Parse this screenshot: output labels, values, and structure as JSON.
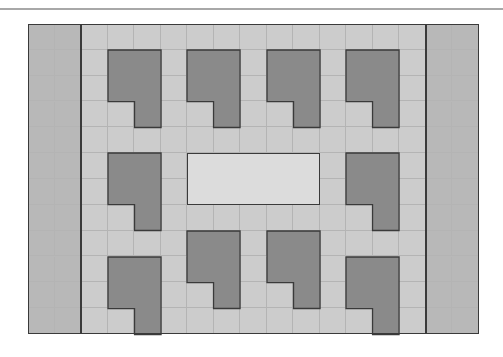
{
  "diagram": {
    "type": "grid-floor-plan",
    "grid": {
      "columns": 17,
      "rows": 12,
      "origin": [
        28,
        24
      ],
      "width": 451,
      "height": 310
    },
    "colors": {
      "floor": "#cccccc",
      "side_panel": "#b8b8b8",
      "block": "#8a8a8a",
      "center_area": "#dcdcdc",
      "grid_line": "#b4b4b4",
      "border": "#3a3a3a",
      "top_rule": "#a8a8a8"
    },
    "side_panels": [
      {
        "name": "left-panel",
        "col": 0,
        "cols": 2
      },
      {
        "name": "right-panel",
        "col": 15,
        "cols": 2
      }
    ],
    "divider_columns": [
      2,
      15
    ],
    "center_area": {
      "col": 6,
      "row": 5,
      "cols": 5,
      "rows": 2
    },
    "blocks": [
      {
        "name": "block-top-1",
        "col": 3,
        "row": 1
      },
      {
        "name": "block-top-2",
        "col": 6,
        "row": 1
      },
      {
        "name": "block-top-3",
        "col": 9,
        "row": 1
      },
      {
        "name": "block-top-4",
        "col": 12,
        "row": 1
      },
      {
        "name": "block-mid-left",
        "col": 3,
        "row": 5
      },
      {
        "name": "block-mid-right",
        "col": 12,
        "row": 5
      },
      {
        "name": "block-bottom-1",
        "col": 3,
        "row": 9
      },
      {
        "name": "block-bottom-2",
        "col": 6,
        "row": 8
      },
      {
        "name": "block-bottom-3",
        "col": 9,
        "row": 8
      },
      {
        "name": "block-bottom-4",
        "col": 12,
        "row": 9
      }
    ],
    "block_shape": "L-shape: 2 columns x 2 rows plus bottom-right cell below"
  }
}
